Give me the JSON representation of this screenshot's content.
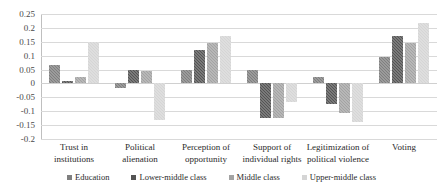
{
  "chart_data": {
    "type": "bar",
    "title": "",
    "xlabel": "",
    "ylabel": "",
    "ylim": [
      -0.2,
      0.25
    ],
    "ytick_step": 0.05,
    "grid": true,
    "legend_position": "bottom",
    "orientation": "vertical",
    "grouping": "grouped",
    "ytick_labels": [
      "0.25",
      "0.2",
      "0.15",
      "0.1",
      "0.05",
      "0",
      "-0.05",
      "-0.1",
      "-0.15",
      "-0.2"
    ],
    "ytick_values": [
      0.25,
      0.2,
      0.15,
      0.1,
      0.05,
      0,
      -0.05,
      -0.1,
      -0.15,
      -0.2
    ],
    "categories": [
      "Trust in institutions",
      "Political alienation",
      "Perception of opportunity",
      "Support of individual rights",
      "Legitimization of political violence",
      "Voting"
    ],
    "category_lines": [
      [
        "Trust in",
        "institutions"
      ],
      [
        "Political",
        "alienation"
      ],
      [
        "Perception of",
        "opportunity"
      ],
      [
        "Support of",
        "individual rights"
      ],
      [
        "Legitimization of",
        "political violence"
      ],
      [
        "Voting",
        ""
      ]
    ],
    "series": [
      {
        "name": "Education",
        "color": "#7f7f7f",
        "values": [
          0.065,
          -0.015,
          0.05,
          0.05,
          0.025,
          0.095
        ]
      },
      {
        "name": "Lower-middle class",
        "color": "#545454",
        "values": [
          0.008,
          0.048,
          0.12,
          -0.125,
          -0.075,
          0.17
        ]
      },
      {
        "name": "Middle class",
        "color": "#a3a3a3",
        "values": [
          0.025,
          0.045,
          0.145,
          -0.125,
          -0.105,
          0.145
        ]
      },
      {
        "name": "Upper-middle class",
        "color": "#d5d5d5",
        "values": [
          0.148,
          -0.132,
          0.172,
          -0.068,
          -0.138,
          0.218
        ]
      }
    ]
  },
  "legend": {
    "items": [
      {
        "label": "Education",
        "color": "#7f7f7f"
      },
      {
        "label": "Lower-middle class",
        "color": "#545454"
      },
      {
        "label": "Middle class",
        "color": "#a3a3a3"
      },
      {
        "label": "Upper-middle class",
        "color": "#d5d5d5"
      }
    ]
  }
}
